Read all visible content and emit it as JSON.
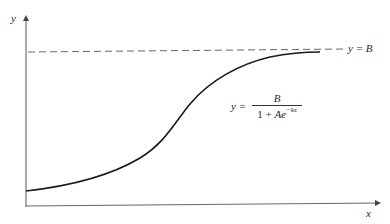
{
  "diagram": {
    "type": "logistic-curve",
    "axes": {
      "x_label": "x",
      "y_label": "y"
    },
    "asymptote": {
      "label": "y = B",
      "style": "dashed"
    },
    "equation": {
      "lhs": "y =",
      "numerator": "B",
      "denominator_prefix": "1 + ",
      "denominator_var": "Ae",
      "exponent": "−kx"
    },
    "colors": {
      "curve": "#1a1a1a",
      "axes": "#555555",
      "asymptote": "#555555",
      "background": "#ffffff"
    }
  }
}
